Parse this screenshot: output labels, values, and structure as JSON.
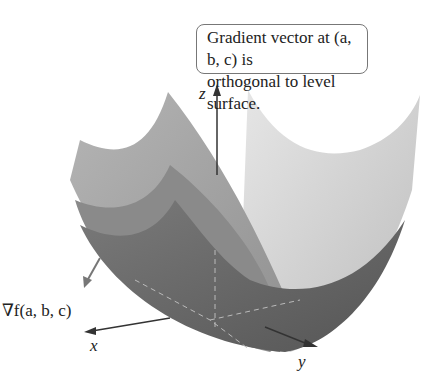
{
  "callout": {
    "line1": "Gradient vector at (a, b, c) is",
    "line2": "orthogonal to level surface."
  },
  "labels": {
    "z_axis": "z",
    "x_axis": "x",
    "y_axis": "y",
    "gradient": "∇f(a, b, c)"
  },
  "colors": {
    "surface_light": "#d4d4d4",
    "surface_mid": "#a6a6a6",
    "surface_dark": "#6e6e6e",
    "axis": "#333333"
  }
}
